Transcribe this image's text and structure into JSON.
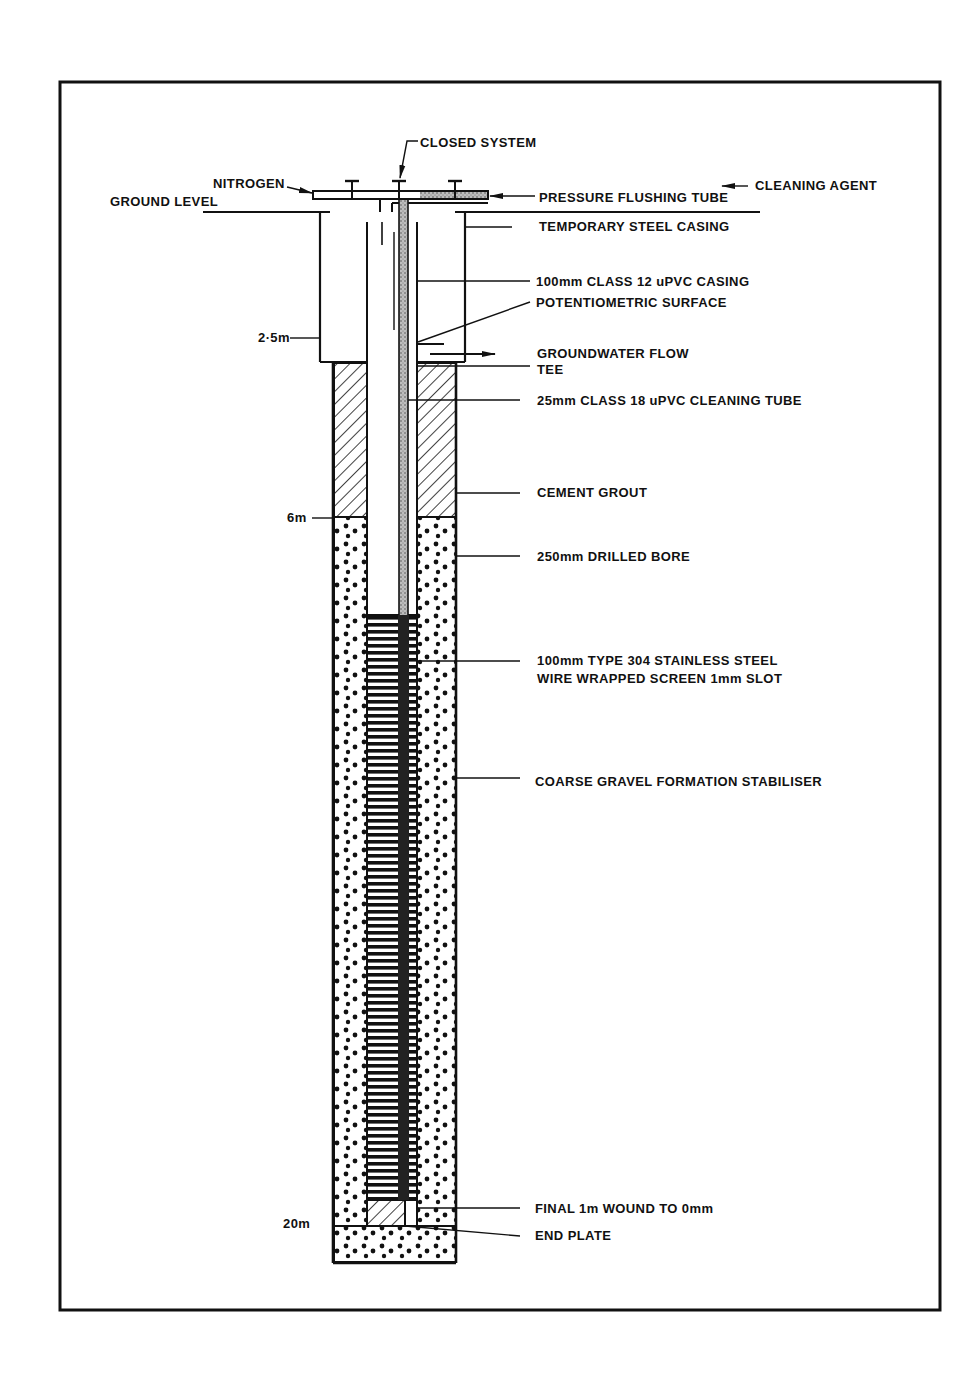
{
  "diagram": {
    "frame": {
      "x": 60,
      "y": 82,
      "width": 880,
      "height": 1228
    },
    "colors": {
      "ink": "#111111",
      "paper": "#ffffff",
      "stipple": "#9a9a9a"
    },
    "labels": {
      "closed_system": "CLOSED SYSTEM",
      "nitrogen": "NITROGEN",
      "ground_level": "GROUND LEVEL",
      "cleaning_agent": "CLEANING AGENT",
      "pressure_flushing_tube": "PRESSURE FLUSHING TUBE",
      "temporary_steel_casing": "TEMPORARY STEEL CASING",
      "upvc_casing": "100mm CLASS 12 uPVC CASING",
      "potentiometric_surface": "POTENTIOMETRIC SURFACE",
      "groundwater_flow": "GROUNDWATER FLOW",
      "tee": "TEE",
      "cleaning_tube": "25mm CLASS 18 uPVC CLEANING TUBE",
      "cement_grout": "CEMENT GROUT",
      "drilled_bore": "250mm DRILLED BORE",
      "screen_line1": "100mm TYPE 304 STAINLESS STEEL",
      "screen_line2": "WIRE WRAPPED SCREEN 1mm SLOT",
      "gravel": "COARSE GRAVEL FORMATION STABILISER",
      "final_wound": "FINAL 1m WOUND TO 0mm",
      "end_plate": "END PLATE"
    },
    "depth_markers": [
      {
        "label": "2·5m",
        "y": 338
      },
      {
        "label": "6m",
        "y": 518
      },
      {
        "label": "20m",
        "y": 1224
      }
    ],
    "layers": [
      {
        "name": "temporary-steel-casing",
        "top_y": 212,
        "bottom_y": 362
      },
      {
        "name": "cement-grout",
        "top_y": 362,
        "bottom_y": 517,
        "depth_to": "6m"
      },
      {
        "name": "coarse-gravel",
        "top_y": 517,
        "bottom_y": 1262,
        "depth_to": "20m"
      },
      {
        "name": "wire-wrapped-screen",
        "top_y": 615,
        "bottom_y": 1200
      },
      {
        "name": "end-plate",
        "top_y": 1200,
        "bottom_y": 1226
      }
    ]
  }
}
